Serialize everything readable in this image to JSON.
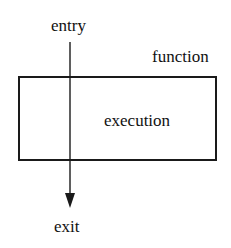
{
  "diagram": {
    "labels": {
      "entry": "entry",
      "function": "function",
      "execution": "execution",
      "exit": "exit"
    },
    "colors": {
      "stroke": "#1a1a1a",
      "text": "#111111",
      "background": "#ffffff"
    }
  }
}
